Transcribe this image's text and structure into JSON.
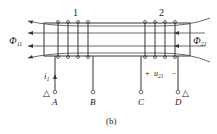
{
  "diagram": {
    "coil1_label": "1",
    "coil2_label": "2",
    "flux_left": {
      "symbol": "Φ",
      "sub": "11"
    },
    "flux_right": {
      "symbol": "Φ",
      "sub": "21"
    },
    "current": {
      "symbol": "i",
      "sub": "1"
    },
    "voltage": {
      "plus": "+",
      "symbol": "u",
      "sub": "21",
      "minus": "−"
    },
    "terminals": [
      "A",
      "B",
      "C",
      "D"
    ],
    "polarity_mark": "△",
    "caption": "(b)"
  }
}
